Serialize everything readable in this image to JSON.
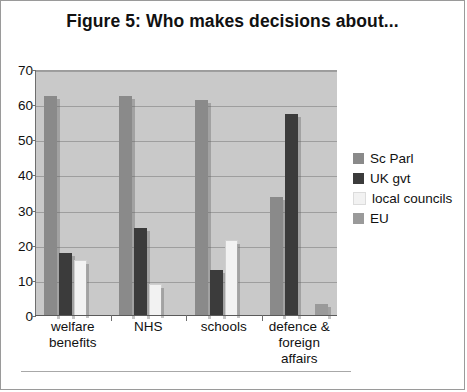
{
  "figure": {
    "title": "Figure 5: Who makes decisions about..."
  },
  "chart_data": {
    "type": "bar",
    "title": "Figure 5: Who makes decisions about...",
    "xlabel": "",
    "ylabel": "",
    "ylim": [
      0,
      70
    ],
    "yticks": [
      0,
      10,
      20,
      30,
      40,
      50,
      60,
      70
    ],
    "ytick_labels": [
      "0",
      "10",
      "20",
      "30",
      "40",
      "50",
      "60",
      "70"
    ],
    "grid": true,
    "legend_position": "right",
    "categories": [
      "welfare benefits",
      "NHS",
      "schools",
      "defence & foreign affairs"
    ],
    "category_lines": [
      [
        "welfare",
        "benefits"
      ],
      [
        "NHS"
      ],
      [
        "schools"
      ],
      [
        "defence &",
        "foreign",
        "affairs"
      ]
    ],
    "series": [
      {
        "name": "Sc Parl",
        "color": "#8a8a8a",
        "values": [
          62.5,
          62.5,
          61.5,
          34.0
        ]
      },
      {
        "name": "UK gvt",
        "color": "#3b3b3b",
        "values": [
          18.0,
          25.0,
          13.0,
          57.5
        ]
      },
      {
        "name": "local councils",
        "color": "#f2f2f2",
        "values": [
          15.8,
          9.0,
          21.5,
          0.0
        ]
      },
      {
        "name": "EU",
        "color": "#9a9a9a",
        "values": [
          0.0,
          0.0,
          0.0,
          3.5
        ]
      }
    ]
  },
  "legend": {
    "items": [
      {
        "label": "Sc Parl",
        "color": "#8a8a8a"
      },
      {
        "label": "UK gvt",
        "color": "#3b3b3b"
      },
      {
        "label": "local councils",
        "color": "#f2f2f2"
      },
      {
        "label": "EU",
        "color": "#9a9a9a"
      }
    ]
  },
  "colors": {
    "plot_background": "#c9c9c9",
    "gridline": "#9e9e9e",
    "axis": "#5a5a5a",
    "page_background": "#ffffff",
    "border": "#9a9a9a"
  }
}
